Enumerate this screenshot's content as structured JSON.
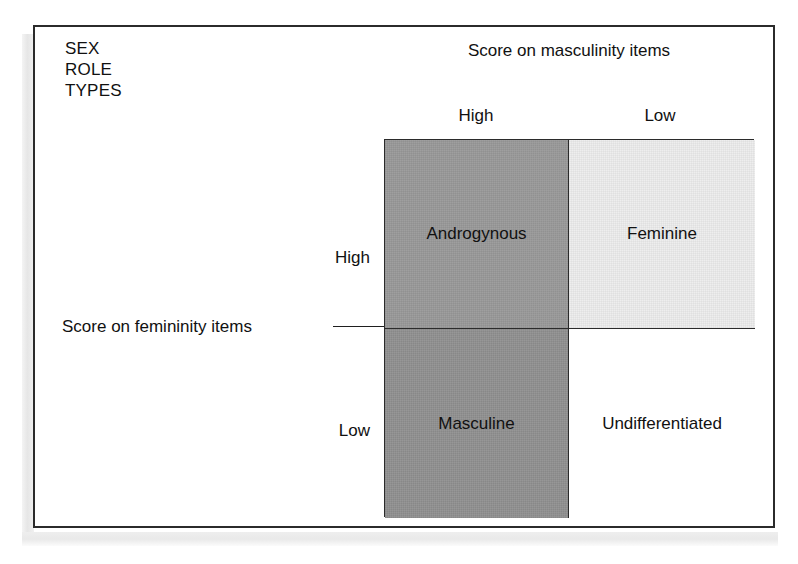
{
  "figure": {
    "corner_title": "SEX\nROLE\nTYPES",
    "column_axis": {
      "caption": "Score on masculinity items",
      "labels": [
        "High",
        "Low"
      ]
    },
    "row_axis": {
      "caption": "Score on femininity items",
      "labels": [
        "High",
        "Low"
      ]
    },
    "cells": [
      {
        "label": "Androgynous",
        "row": "High",
        "column": "High",
        "fill": "#9a9a9a"
      },
      {
        "label": "Feminine",
        "row": "High",
        "column": "Low",
        "fill": "#ededed"
      },
      {
        "label": "Masculine",
        "row": "Low",
        "column": "High",
        "fill": "#919191"
      },
      {
        "label": "Undifferentiated",
        "row": "Low",
        "column": "Low",
        "fill": "#ffffff"
      }
    ],
    "border_color": "#2b2b2b",
    "text_color": "#111111",
    "background": "#ffffff"
  },
  "chart_data": {
    "type": "table",
    "title": "SEX ROLE TYPES",
    "xlabel": "Score on masculinity items",
    "ylabel": "Score on femininity items",
    "columns": [
      "High",
      "Low"
    ],
    "rows": [
      "High",
      "Low"
    ],
    "values": [
      [
        "Androgynous",
        "Feminine"
      ],
      [
        "Masculine",
        "Undifferentiated"
      ]
    ],
    "cell_fills": [
      [
        "#9a9a9a",
        "#ededed"
      ],
      [
        "#919191",
        "#ffffff"
      ]
    ],
    "grid": true,
    "legend": "none"
  }
}
